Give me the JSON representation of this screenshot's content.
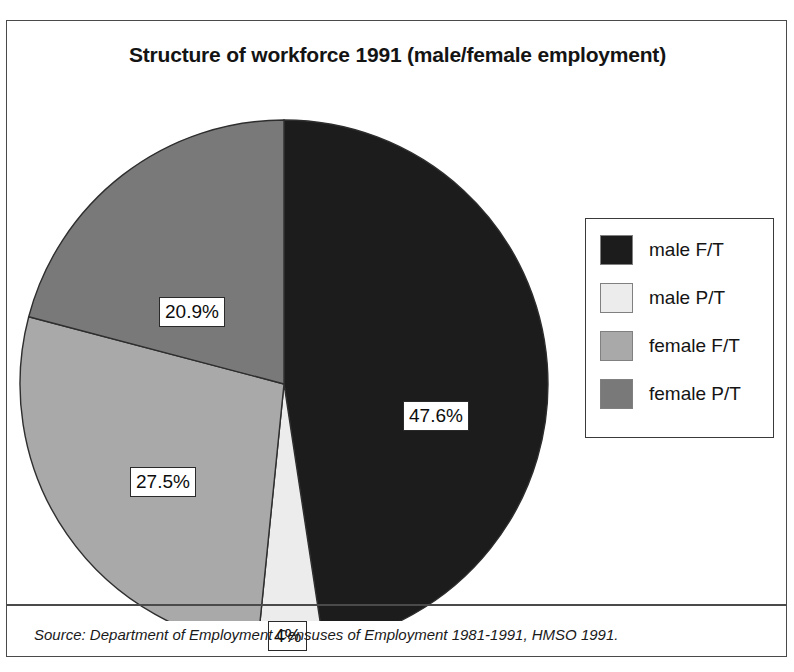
{
  "figure": {
    "title": "Structure of workforce 1991 (male/female employment)",
    "source_note": "Source: Department of Employment Censuses of Employment 1981-1991, HMSO 1991."
  },
  "legend": {
    "items": [
      {
        "label": "male F/T",
        "color": "#1c1c1c"
      },
      {
        "label": "male P/T",
        "color": "#ececec"
      },
      {
        "label": "female F/T",
        "color": "#a9a9a9"
      },
      {
        "label": "female P/T",
        "color": "#797979"
      }
    ]
  },
  "labels": {
    "male_ft": "47.6%",
    "male_pt": "4%",
    "female_ft": "27.5%",
    "female_pt": "20.9%"
  },
  "chart_data": {
    "type": "pie",
    "title": "Structure of workforce 1991 (male/female employment)",
    "xlabel": "",
    "ylabel": "",
    "legend_position": "right",
    "grid": false,
    "start_angle_deg": 0,
    "direction": "clockwise",
    "units": "percent",
    "categories": [
      "male F/T",
      "male P/T",
      "female F/T",
      "female P/T"
    ],
    "values": [
      47.6,
      4.0,
      27.5,
      20.9
    ],
    "data_labels": [
      "47.6%",
      "4%",
      "27.5%",
      "20.9%"
    ],
    "colors": [
      "#1c1c1c",
      "#ececec",
      "#a9a9a9",
      "#797979"
    ],
    "slices": [
      {
        "name": "male F/T",
        "value": 47.6,
        "label": "47.6%",
        "color": "#1c1c1c"
      },
      {
        "name": "male P/T",
        "value": 4.0,
        "label": "4%",
        "color": "#ececec"
      },
      {
        "name": "female F/T",
        "value": 27.5,
        "label": "27.5%",
        "color": "#a9a9a9"
      },
      {
        "name": "female P/T",
        "value": 20.9,
        "label": "20.9%",
        "color": "#797979"
      }
    ],
    "total": 100.0,
    "annotations": [
      "Source: Department of Employment Censuses of Employment 1981-1991, HMSO 1991."
    ]
  }
}
